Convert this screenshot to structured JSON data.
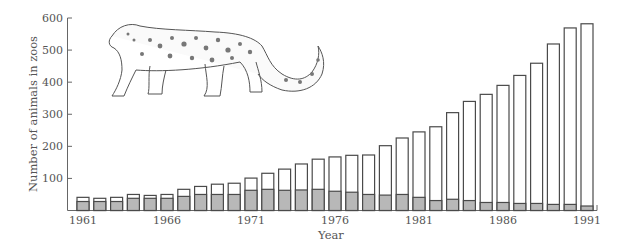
{
  "chart_data": {
    "type": "bar",
    "stacked": true,
    "title": "",
    "xlabel": "Year",
    "ylabel": "Number of animals in zoos",
    "ylim": [
      0,
      600
    ],
    "yticks": [
      100,
      200,
      300,
      400,
      500,
      600
    ],
    "xtick_labels": [
      "1961",
      "1966",
      "1971",
      "1976",
      "1981",
      "1986",
      "1991"
    ],
    "grid": false,
    "legend": null,
    "illustration": "snow-leopard drawing (upper left)",
    "categories": [
      "1961",
      "1962",
      "1963",
      "1964",
      "1965",
      "1966",
      "1967",
      "1968",
      "1969",
      "1970",
      "1971",
      "1972",
      "1973",
      "1974",
      "1975",
      "1976",
      "1977",
      "1978",
      "1979",
      "1980",
      "1981",
      "1982",
      "1983",
      "1984",
      "1985",
      "1986",
      "1987",
      "1988",
      "1989",
      "1990",
      "1991"
    ],
    "totals": [
      41,
      38,
      41,
      50,
      47,
      50,
      66,
      75,
      82,
      85,
      101,
      116,
      129,
      145,
      160,
      167,
      172,
      173,
      202,
      226,
      245,
      261,
      305,
      340,
      362,
      390,
      421,
      459,
      519,
      569,
      582
    ],
    "series": [
      {
        "name": "gray (lower) portion",
        "color": "#b8b8b8",
        "values": [
          28,
          28,
          28,
          38,
          38,
          38,
          44,
          50,
          50,
          50,
          63,
          66,
          63,
          64,
          66,
          60,
          57,
          50,
          48,
          50,
          41,
          31,
          35,
          31,
          25,
          25,
          22,
          22,
          19,
          19,
          14
        ]
      },
      {
        "name": "white (upper) portion",
        "color": "#ffffff",
        "values": [
          13,
          10,
          13,
          12,
          9,
          12,
          22,
          25,
          32,
          35,
          38,
          50,
          66,
          81,
          94,
          107,
          115,
          123,
          154,
          176,
          204,
          230,
          270,
          309,
          337,
          365,
          399,
          437,
          500,
          550,
          568
        ]
      }
    ]
  },
  "colors": {
    "bar_outline": "#4a4a4a",
    "gray_fill": "#b8b8b8",
    "axis": "#666666"
  }
}
